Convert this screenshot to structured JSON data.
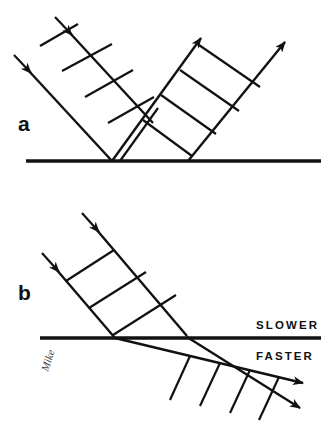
{
  "figure": {
    "title_remnant": "",
    "background_color": "#ffffff",
    "ink_color": "#111111",
    "width": 330,
    "height": 421,
    "signature": "Mike"
  },
  "panels": [
    {
      "id": "a",
      "label": "a",
      "label_x": 18,
      "label_y": 131,
      "phenomenon": "reflection",
      "boundary": {
        "name": "reflecting-surface",
        "x1": 26,
        "y1": 161,
        "x2": 321,
        "y2": 161,
        "thickness": 3.6
      },
      "incident_beam": {
        "name": "incident-beam-a",
        "direction": "down-right",
        "angle_deg": 45,
        "ray_count": 2,
        "wavefront_count": 4,
        "rays": [
          {
            "x1": 22,
            "y1": 63,
            "x2": 112,
            "y2": 161
          },
          {
            "x1": 63,
            "y1": 25,
            "x2": 153,
            "y2": 123
          }
        ],
        "wavefronts": [
          {
            "x1": 40,
            "y1": 46,
            "x2": 77,
            "y2": 24
          },
          {
            "x1": 63,
            "y1": 72,
            "x2": 110,
            "y2": 45
          },
          {
            "x1": 85,
            "y1": 97,
            "x2": 131,
            "y2": 70
          },
          {
            "x1": 108,
            "y1": 122,
            "x2": 153,
            "y2": 96
          }
        ],
        "arrows": [
          {
            "x": 22,
            "y": 63,
            "dir_deg": 47
          },
          {
            "x": 63,
            "y": 25,
            "dir_deg": 47
          }
        ]
      },
      "reflected_beam": {
        "name": "reflected-beam-a",
        "direction": "up-right",
        "angle_deg": 45,
        "ray_count": 2,
        "wavefront_count": 4,
        "rays": [
          {
            "x1": 112,
            "y1": 161,
            "x2": 207,
            "y2": 30
          },
          {
            "x1": 188,
            "y1": 161,
            "x2": 290,
            "y2": 35
          }
        ],
        "wavefronts": [
          {
            "x1": 142,
            "y1": 120,
            "x2": 190,
            "y2": 155
          },
          {
            "x1": 160,
            "y1": 95,
            "x2": 215,
            "y2": 133
          },
          {
            "x1": 180,
            "y1": 70,
            "x2": 238,
            "y2": 110
          },
          {
            "x1": 199,
            "y1": 45,
            "x2": 259,
            "y2": 86
          }
        ],
        "arrows": [
          {
            "x": 207,
            "y": 30,
            "dir_deg": -53
          },
          {
            "x": 290,
            "y": 35,
            "dir_deg": -51
          }
        ]
      }
    },
    {
      "id": "b",
      "label": "b",
      "label_x": 18,
      "label_y": 300,
      "phenomenon": "refraction",
      "boundary": {
        "name": "refracting-interface",
        "x1": 40,
        "y1": 338,
        "x2": 321,
        "y2": 338,
        "thickness": 3.6
      },
      "medium_labels": [
        {
          "name": "slower-medium-label",
          "text": "SLOWER",
          "x": 256,
          "y": 329
        },
        {
          "name": "faster-medium-label",
          "text": "FASTER",
          "x": 256,
          "y": 360
        }
      ],
      "incident_beam": {
        "name": "incident-beam-b",
        "direction": "down-right",
        "angle_deg": 45,
        "ray_count": 2,
        "wavefront_count": 3,
        "rays": [
          {
            "x1": 50,
            "y1": 262,
            "x2": 115,
            "y2": 338
          },
          {
            "x1": 90,
            "y1": 222,
            "x2": 187,
            "y2": 336
          }
        ],
        "wavefronts": [
          {
            "x1": 65,
            "y1": 280,
            "x2": 113,
            "y2": 249
          },
          {
            "x1": 88,
            "y1": 307,
            "x2": 145,
            "y2": 271
          },
          {
            "x1": 112,
            "y1": 334,
            "x2": 175,
            "y2": 294
          }
        ],
        "arrows": [
          {
            "x": 50,
            "y": 262,
            "dir_deg": 49
          },
          {
            "x": 90,
            "y": 222,
            "dir_deg": 49
          }
        ]
      },
      "refracted_beam": {
        "name": "refracted-beam-b",
        "direction": "down-right-shallow",
        "angle_deg": 22,
        "ray_count": 2,
        "wavefront_count": 4,
        "wavelength_note": "wider spacing than incident beam",
        "rays": [
          {
            "x1": 115,
            "y1": 338,
            "x2": 310,
            "y2": 385
          },
          {
            "x1": 187,
            "y1": 336,
            "x2": 308,
            "y2": 412
          }
        ],
        "wavefronts": [
          {
            "x1": 186,
            "y1": 355,
            "x2": 165,
            "y2": 400
          },
          {
            "x1": 216,
            "y1": 362,
            "x2": 196,
            "y2": 406
          },
          {
            "x1": 246,
            "y1": 369,
            "x2": 226,
            "y2": 412
          },
          {
            "x1": 276,
            "y1": 376,
            "x2": 256,
            "y2": 419
          }
        ],
        "arrows": [
          {
            "x": 310,
            "y": 385,
            "dir_deg": 14
          },
          {
            "x": 308,
            "y": 412,
            "dir_deg": 30
          }
        ]
      }
    }
  ]
}
